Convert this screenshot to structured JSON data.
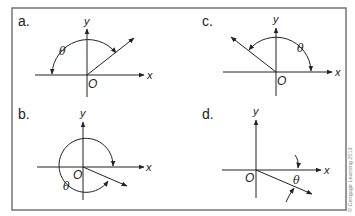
{
  "figure": {
    "frame_color": "#6b6b6b",
    "line_color": "#222222",
    "copyright": "© Cengage Learning 2013"
  },
  "panels": [
    {
      "id": "a",
      "label": "a.",
      "x_label": "x",
      "y_label": "y",
      "origin_label": "O",
      "angle_label": "θ",
      "description": "Ray in first quadrant; angle measured clockwise from negative x-axis over the top to the ray"
    },
    {
      "id": "b",
      "label": "b.",
      "x_label": "x",
      "y_label": "y",
      "origin_label": "O",
      "angle_label": "θ",
      "description": "Ray in fourth quadrant; angle measured clockwise nearly full turn from positive x-axis to ray"
    },
    {
      "id": "c",
      "label": "c.",
      "x_label": "x",
      "y_label": "y",
      "origin_label": "O",
      "angle_label": "θ",
      "description": "Ray in second quadrant; angle measured counterclockwise from positive x-axis to ray"
    },
    {
      "id": "d",
      "label": "d.",
      "x_label": "x",
      "y_label": "y",
      "origin_label": "O",
      "angle_label": "θ",
      "description": "Ray in fourth quadrant; small clockwise angle from positive x-axis to ray indicated by two arrows"
    }
  ]
}
